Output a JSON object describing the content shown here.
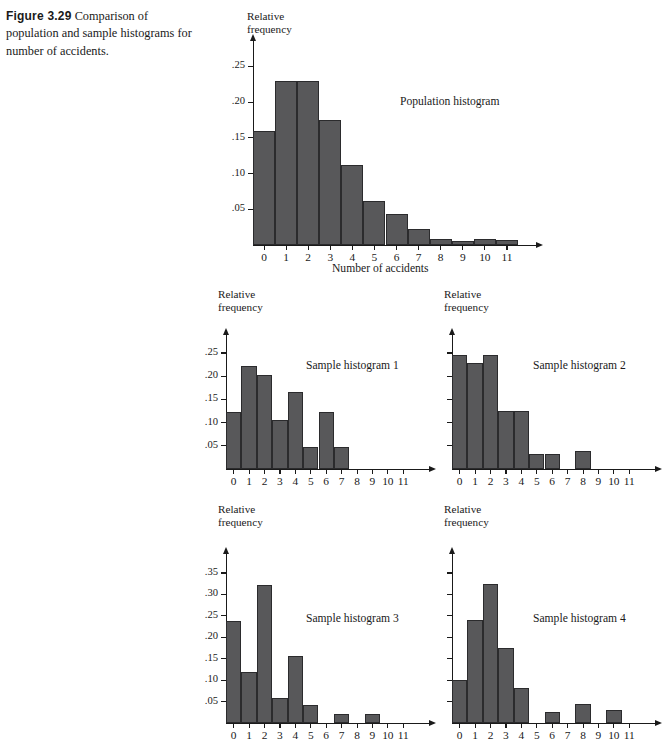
{
  "caption": {
    "figure_number": "Figure 3.29",
    "text": " Comparison of population and sample histograms for number of accidents."
  },
  "style": {
    "bar_fill": "#58585a",
    "bar_stroke": "#2b2b2d",
    "axis_color": "#1a1a1a",
    "background": "#ffffff"
  },
  "common": {
    "y_axis_title": "Relative\nfrequency",
    "x_categories": [
      "0",
      "1",
      "2",
      "3",
      "4",
      "5",
      "6",
      "7",
      "8",
      "9",
      "10",
      "11"
    ]
  },
  "chart_data": [
    {
      "id": "population",
      "type": "bar",
      "title": "Population histogram",
      "xlabel": "Number of accidents",
      "ylabel": "Relative frequency",
      "categories": [
        "0",
        "1",
        "2",
        "3",
        "4",
        "5",
        "6",
        "7",
        "8",
        "9",
        "10",
        "11"
      ],
      "values": [
        0.16,
        0.229,
        0.229,
        0.175,
        0.112,
        0.062,
        0.043,
        0.022,
        0.009,
        0.006,
        0.009,
        0.007
      ],
      "ylim": [
        0,
        0.28
      ],
      "yticks": [
        0.05,
        0.1,
        0.15,
        0.2,
        0.25
      ],
      "ytick_labels": [
        ".05",
        ".10",
        ".15",
        ".20",
        ".25"
      ],
      "grid": false,
      "legend": "none"
    },
    {
      "id": "sample1",
      "type": "bar",
      "title": "Sample histogram 1",
      "xlabel": "",
      "ylabel": "Relative frequency",
      "categories": [
        "0",
        "1",
        "2",
        "3",
        "4",
        "5",
        "6",
        "7",
        "8",
        "9",
        "10",
        "11"
      ],
      "values": [
        0.122,
        0.222,
        0.203,
        0.105,
        0.165,
        0.048,
        0.123,
        0.048,
        0.0,
        0.0,
        0.0,
        0.0
      ],
      "ylim": [
        0,
        0.28
      ],
      "yticks": [
        0.05,
        0.1,
        0.15,
        0.2,
        0.25
      ],
      "ytick_labels": [
        ".05",
        ".10",
        ".15",
        ".20",
        ".25"
      ],
      "grid": false,
      "legend": "none"
    },
    {
      "id": "sample2",
      "type": "bar",
      "title": "Sample histogram 2",
      "xlabel": "",
      "ylabel": "Relative frequency",
      "categories": [
        "0",
        "1",
        "2",
        "3",
        "4",
        "5",
        "6",
        "7",
        "8",
        "9",
        "10",
        "11"
      ],
      "values": [
        0.245,
        0.228,
        0.245,
        0.125,
        0.125,
        0.032,
        0.032,
        0.0,
        0.038,
        0.0,
        0.0,
        0.0
      ],
      "ylim": [
        0,
        0.28
      ],
      "yticks": [
        0.05,
        0.1,
        0.15,
        0.2,
        0.25
      ],
      "ytick_labels": [
        "",
        "",
        "",
        "",
        ""
      ],
      "grid": false,
      "legend": "none"
    },
    {
      "id": "sample3",
      "type": "bar",
      "title": "Sample histogram 3",
      "xlabel": "",
      "ylabel": "Relative frequency",
      "categories": [
        "0",
        "1",
        "2",
        "3",
        "4",
        "5",
        "6",
        "7",
        "8",
        "9",
        "10",
        "11"
      ],
      "values": [
        0.238,
        0.118,
        0.322,
        0.058,
        0.156,
        0.042,
        0.0,
        0.022,
        0.0,
        0.022,
        0.0,
        0.0
      ],
      "ylim": [
        0,
        0.385
      ],
      "yticks": [
        0.05,
        0.1,
        0.15,
        0.2,
        0.25,
        0.3,
        0.35
      ],
      "ytick_labels": [
        ".05",
        ".10",
        ".15",
        ".20",
        ".25",
        ".30",
        ".35"
      ],
      "grid": false,
      "legend": "none"
    },
    {
      "id": "sample4",
      "type": "bar",
      "title": "Sample histogram 4",
      "xlabel": "",
      "ylabel": "Relative frequency",
      "categories": [
        "0",
        "1",
        "2",
        "3",
        "4",
        "5",
        "6",
        "7",
        "8",
        "9",
        "10",
        "11"
      ],
      "values": [
        0.1,
        0.24,
        0.325,
        0.175,
        0.082,
        0.0,
        0.025,
        0.0,
        0.045,
        0.0,
        0.03,
        0.0
      ],
      "ylim": [
        0,
        0.385
      ],
      "yticks": [
        0.05,
        0.1,
        0.15,
        0.2,
        0.25,
        0.3,
        0.35
      ],
      "ytick_labels": [
        "",
        "",
        "",
        "",
        "",
        "",
        ""
      ],
      "grid": false,
      "legend": "none"
    }
  ]
}
